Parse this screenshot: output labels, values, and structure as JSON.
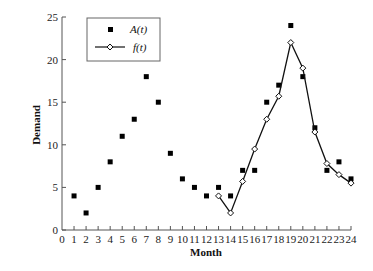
{
  "chart_data": {
    "type": "line",
    "title": "",
    "xlabel": "Month",
    "ylabel": "Demand",
    "xlim": [
      0,
      24
    ],
    "ylim": [
      0,
      25
    ],
    "grid": false,
    "legend_position": "upper-left",
    "x_ticks": [
      0,
      1,
      2,
      3,
      4,
      5,
      6,
      7,
      8,
      9,
      10,
      11,
      12,
      13,
      14,
      15,
      16,
      17,
      18,
      19,
      20,
      21,
      22,
      23,
      24
    ],
    "y_ticks": [
      0,
      5,
      10,
      15,
      20,
      25
    ],
    "series": [
      {
        "name": "A(t)",
        "style": "markers",
        "marker": "filled-square",
        "x": [
          1,
          2,
          3,
          4,
          5,
          6,
          7,
          8,
          9,
          10,
          11,
          12,
          13,
          14,
          15,
          16,
          17,
          18,
          19,
          20,
          21,
          22,
          23,
          24
        ],
        "values": [
          4,
          2,
          5,
          8,
          11,
          13,
          18,
          15,
          9,
          6,
          5,
          4,
          5,
          4,
          7,
          7,
          15,
          17,
          24,
          18,
          12,
          7,
          8,
          6
        ]
      },
      {
        "name": "f(t)",
        "style": "line+markers",
        "marker": "open-diamond",
        "x": [
          13,
          14,
          15,
          16,
          17,
          18,
          19,
          20,
          21,
          22,
          23,
          24
        ],
        "values": [
          4,
          2,
          5.7,
          9.5,
          13,
          15.7,
          22,
          19,
          11.5,
          7.8,
          6.5,
          5.5
        ]
      }
    ]
  },
  "legend": {
    "items": [
      {
        "label": "A(t)",
        "symbol": "filled-square"
      },
      {
        "label": "f(t)",
        "symbol": "line-open-diamond"
      }
    ]
  },
  "colors": {
    "axis": "#555555",
    "marker": "#000000",
    "line": "#111111",
    "background": "#ffffff"
  }
}
